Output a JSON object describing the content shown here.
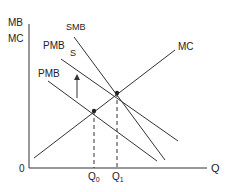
{
  "diagram": {
    "type": "economics-externality",
    "colors": {
      "line": "#333333",
      "background": "#ffffff"
    },
    "axes": {
      "y_label_top": "MB",
      "y_label_bottom": "MC",
      "x_label": "Q",
      "origin": "0"
    },
    "curves": {
      "mc": "MC",
      "smb": "SMB",
      "pmb_shifted": "PMB",
      "s": "S",
      "pmb": "PMB"
    },
    "ticks": {
      "q0": "Q",
      "q0_sub": "0",
      "q1": "Q",
      "q1_sub": "1"
    },
    "annotations": {
      "arrow": "upward shift arrow"
    }
  }
}
